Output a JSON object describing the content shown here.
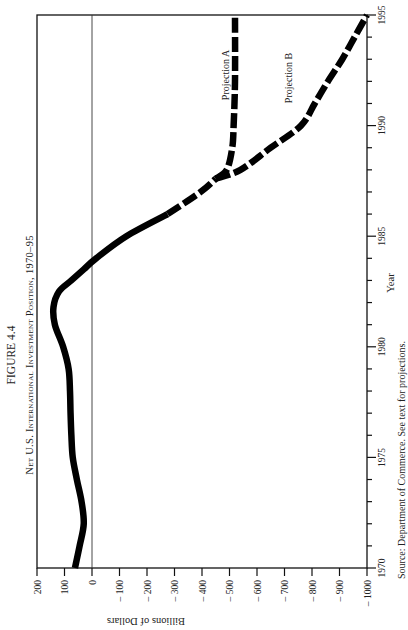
{
  "figure": {
    "label": "FIGURE 4.4",
    "title": "Net U.S. International Investment Position, 1970–95",
    "source": "Source: Department of Commerce. See text for projections.",
    "orientation": "rotated 90° counter-clockwise on page"
  },
  "chart_data": {
    "type": "line",
    "title": "Net U.S. International Investment Position, 1970–95",
    "xlabel": "Year",
    "ylabel": "Billions of Dollars",
    "xlim": [
      1970,
      1995
    ],
    "ylim": [
      -1000,
      200
    ],
    "x_ticks": [
      1970,
      1975,
      1980,
      1985,
      1990,
      1995
    ],
    "x_minor_tick_step": 1,
    "y_ticks": [
      200,
      100,
      0,
      -100,
      -200,
      -300,
      -400,
      -500,
      -600,
      -700,
      -800,
      -900,
      -1000
    ],
    "y_tick_labels": [
      "200",
      "100",
      "0",
      "– 100",
      "– 200",
      "– 300",
      "– 400",
      "– 500",
      "– 600",
      "– 700",
      "– 800",
      "– 900",
      "– 1000"
    ],
    "zero_line": true,
    "grid": false,
    "legend": "none (inline labels)",
    "series": [
      {
        "name": "Actual",
        "style": "solid",
        "x": [
          1970,
          1971,
          1972,
          1973,
          1974,
          1975,
          1976,
          1977,
          1978,
          1979,
          1980,
          1981,
          1981.8,
          1982.5,
          1983,
          1983.5,
          1984,
          1985,
          1986
        ],
        "y": [
          62,
          45,
          30,
          38,
          55,
          70,
          75,
          78,
          80,
          85,
          105,
          135,
          140,
          120,
          75,
          30,
          -15,
          -125,
          -275
        ]
      },
      {
        "name": "Transition",
        "style": "dashed",
        "x": [
          1986,
          1987,
          1987.6
        ],
        "y": [
          -275,
          -395,
          -450
        ]
      },
      {
        "name": "Projection A",
        "style": "dashed",
        "x": [
          1987.6,
          1988,
          1989,
          1990,
          1992,
          1995
        ],
        "y": [
          -450,
          -490,
          -510,
          -515,
          -520,
          -520
        ]
      },
      {
        "name": "Projection B",
        "style": "dashed",
        "x": [
          1987.6,
          1988,
          1989,
          1990,
          1991,
          1992,
          1993,
          1994,
          1995
        ],
        "y": [
          -450,
          -540,
          -650,
          -760,
          -810,
          -858,
          -910,
          -955,
          -1000
        ]
      }
    ],
    "annotations": [
      {
        "text": "Projection A",
        "near_x": 1991.5,
        "near_y": -470
      },
      {
        "text": "Projection B",
        "near_x": 1991.3,
        "near_y": -700
      }
    ]
  },
  "labels": {
    "figure_label": "FIGURE 4.4",
    "title": "Net U.S. International Investment Position, 1970–95",
    "projection_a": "Projection A",
    "projection_b": "Projection B",
    "ylabel": "Billions of Dollars",
    "xlabel": "Year",
    "source": "Source: Department of Commerce. See text for projections."
  }
}
